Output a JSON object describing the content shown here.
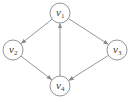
{
  "graph": {
    "type": "directed",
    "colors": {
      "stroke": "#8a8a8a",
      "text": "#3a3a3a",
      "fill": "#ffffff"
    },
    "nodes": [
      {
        "id": "v1",
        "base": "v",
        "sub": "1",
        "x": 60,
        "y": 13
      },
      {
        "id": "v2",
        "base": "v",
        "sub": "2",
        "x": 13,
        "y": 50
      },
      {
        "id": "v3",
        "base": "v",
        "sub": "3",
        "x": 117,
        "y": 50
      },
      {
        "id": "v4",
        "base": "v",
        "sub": "4",
        "x": 60,
        "y": 86
      }
    ],
    "edges": [
      {
        "from": "v1",
        "to": "v2"
      },
      {
        "from": "v1",
        "to": "v3"
      },
      {
        "from": "v2",
        "to": "v4"
      },
      {
        "from": "v3",
        "to": "v4"
      },
      {
        "from": "v4",
        "to": "v1"
      }
    ]
  }
}
